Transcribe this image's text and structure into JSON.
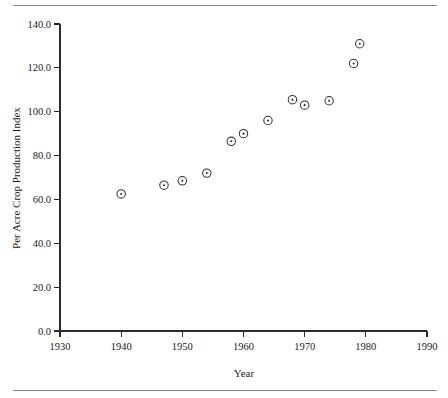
{
  "figure": {
    "has_top_rule": true,
    "has_bottom_rule": true,
    "rule_color": "#8a8a8a",
    "background": "#ffffff",
    "ink_color": "#1a1a1a"
  },
  "chart_data": {
    "type": "scatter",
    "title": "",
    "xlabel": "Year",
    "ylabel": "Per Acre Crop Production Index",
    "xlim": [
      1930,
      1990
    ],
    "ylim": [
      0.0,
      140.0
    ],
    "xticks": [
      1930,
      1940,
      1950,
      1960,
      1970,
      1980,
      1990
    ],
    "xtick_labels": [
      "1930",
      "1940",
      "1950",
      "1960",
      "1970",
      "1980",
      "1990"
    ],
    "yticks": [
      0.0,
      20.0,
      40.0,
      60.0,
      80.0,
      100.0,
      120.0,
      140.0
    ],
    "ytick_labels": [
      "0.0",
      "20.0",
      "40.0",
      "60.0",
      "80.0",
      "100.0",
      "120.0",
      "140.0"
    ],
    "grid": false,
    "legend": false,
    "marker_style": "open-circle-with-center-dot",
    "marker_color": "#333333",
    "series": [
      {
        "name": "Per Acre Crop Production Index",
        "points": [
          {
            "x": 1940,
            "y": 62.5
          },
          {
            "x": 1947,
            "y": 66.5
          },
          {
            "x": 1950,
            "y": 68.5
          },
          {
            "x": 1954,
            "y": 72.0
          },
          {
            "x": 1958,
            "y": 86.5
          },
          {
            "x": 1960,
            "y": 90.0
          },
          {
            "x": 1964,
            "y": 96.0
          },
          {
            "x": 1968,
            "y": 105.5
          },
          {
            "x": 1970,
            "y": 103.0
          },
          {
            "x": 1974,
            "y": 105.0
          },
          {
            "x": 1978,
            "y": 122.0
          },
          {
            "x": 1979,
            "y": 131.0
          }
        ]
      }
    ]
  }
}
